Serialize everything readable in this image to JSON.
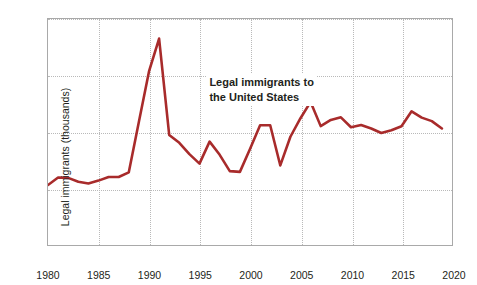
{
  "chart_data": {
    "type": "line",
    "title": "",
    "xlabel": "Year",
    "ylabel": "Legal immigrants (thousands)",
    "xlim": [
      1980,
      2020
    ],
    "ylim": [
      0,
      2000
    ],
    "grid": true,
    "legend_position": "none",
    "line_color": "#A82B2B",
    "annotations": [
      {
        "text_line1": "Legal immigrants to",
        "text_line2": "the United States",
        "x": 1996,
        "y": 1430
      }
    ],
    "xticks": [
      "1980",
      "1985",
      "1990",
      "1995",
      "2000",
      "2005",
      "2010",
      "2015",
      "2020"
    ],
    "xtick_values": [
      1980,
      1985,
      1990,
      1995,
      2000,
      2005,
      2010,
      2015,
      2020
    ],
    "yticks": [
      "0",
      "500",
      "1,000",
      "1,500",
      "2,000"
    ],
    "ytick_values": [
      0,
      500,
      1000,
      1500,
      2000
    ],
    "series": [
      {
        "name": "Legal immigrants to the United States",
        "x": [
          1980,
          1981,
          1982,
          1983,
          1984,
          1985,
          1986,
          1987,
          1988,
          1989,
          1990,
          1991,
          1992,
          1993,
          1994,
          1995,
          1996,
          1997,
          1998,
          1999,
          2000,
          2001,
          2002,
          2003,
          2004,
          2005,
          2006,
          2007,
          2008,
          2009,
          2010,
          2011,
          2012,
          2013,
          2014,
          2015,
          2016,
          2017,
          2018,
          2019
        ],
        "values": [
          531,
          597,
          594,
          560,
          544,
          570,
          602,
          602,
          643,
          1091,
          1536,
          1827,
          974,
          904,
          804,
          720,
          915,
          798,
          654,
          647,
          850,
          1059,
          1060,
          704,
          958,
          1122,
          1266,
          1052,
          1107,
          1130,
          1042,
          1062,
          1031,
          991,
          1016,
          1051,
          1183,
          1127,
          1096,
          1031
        ]
      }
    ]
  }
}
